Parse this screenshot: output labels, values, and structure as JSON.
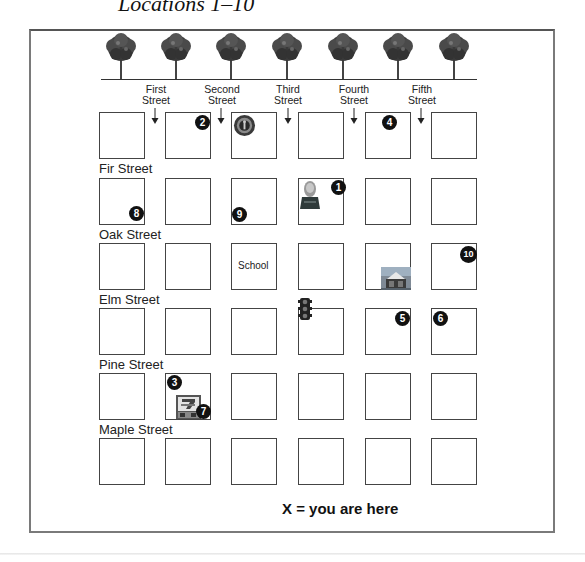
{
  "title": "Locations 1–10",
  "legend": "X = you are here",
  "scenery": {
    "tree_count": 7,
    "tree_icon": "tree-icon"
  },
  "vertical_streets": [
    {
      "line1": "First",
      "line2": "Street"
    },
    {
      "line1": "Second",
      "line2": "Street"
    },
    {
      "line1": "Third",
      "line2": "Street"
    },
    {
      "line1": "Fourth",
      "line2": "Street"
    },
    {
      "line1": "Fifth",
      "line2": "Street"
    }
  ],
  "horizontal_streets": [
    "Fir Street",
    "Oak Street",
    "Elm Street",
    "Pine Street",
    "Maple Street"
  ],
  "grid": {
    "rows": 6,
    "cols": 6
  },
  "landmarks": [
    {
      "label": "School",
      "row": 3,
      "col": 3,
      "type": "text"
    },
    {
      "name": "Starbucks coffee shop",
      "icon": "starbucks-logo-icon",
      "row": 1,
      "col": 3
    },
    {
      "name": "Statue / monument",
      "icon": "statue-icon",
      "row": 2,
      "col": 4
    },
    {
      "name": "Building / theater",
      "icon": "building-icon",
      "row": 3,
      "col": 5
    },
    {
      "name": "7-Eleven store",
      "icon": "seven-eleven-icon",
      "row": 5,
      "col": 2
    },
    {
      "name": "Traffic light",
      "icon": "traffic-light-icon",
      "row": 4,
      "col": 4
    }
  ],
  "locations": [
    {
      "number": "1",
      "row": 2,
      "col": 4
    },
    {
      "number": "2",
      "row": 1,
      "col": 2
    },
    {
      "number": "3",
      "row": 5,
      "col": 2
    },
    {
      "number": "4",
      "row": 1,
      "col": 5
    },
    {
      "number": "5",
      "row": 4,
      "col": 5
    },
    {
      "number": "6",
      "row": 4,
      "col": 6
    },
    {
      "number": "7",
      "row": 5,
      "col": 2
    },
    {
      "number": "8",
      "row": 2,
      "col": 1
    },
    {
      "number": "9",
      "row": 2,
      "col": 3
    },
    {
      "number": "10",
      "row": 3,
      "col": 6
    }
  ],
  "colors": {
    "marker": "#111111",
    "frame": "#7a7a7a",
    "block_border": "#444444"
  }
}
